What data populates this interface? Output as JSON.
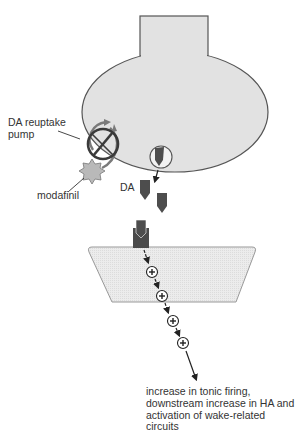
{
  "diagram": {
    "labels": {
      "reuptake_pump": "DA reuptake\npump",
      "reuptake_pump_line1": "DA reuptake",
      "reuptake_pump_line2": "pump",
      "modafinil": "modafinil",
      "dopamine": "DA",
      "outcome": "increase in tonic firing, downstream increase in HA and activation of wake-related circuits"
    },
    "signal_markers": [
      "+",
      "+",
      "+",
      "+"
    ],
    "colors": {
      "neuron_fill": "#e2e2e2",
      "neuron_stroke": "#555555",
      "postsynaptic_fill": "#ebebeb",
      "dopamine": "#4d4d4d",
      "receptor": "#4a4a4a",
      "modafinil": "#b9b9b9",
      "block_symbol": "#3a3a3a",
      "text": "#333333"
    }
  }
}
